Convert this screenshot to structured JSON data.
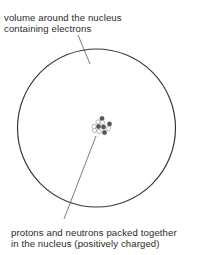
{
  "labels": {
    "electron_cloud": {
      "line1": "volume around the nucleus",
      "line2": "containing electrons"
    },
    "nucleus": {
      "line1": "protons and neutrons packed together",
      "line2": "in the nucleus (positively charged)"
    }
  },
  "colors": {
    "outline": "#3a3a3a",
    "proton": "#555555",
    "neutron": "#ffffff",
    "text": "#2a2a2a"
  }
}
